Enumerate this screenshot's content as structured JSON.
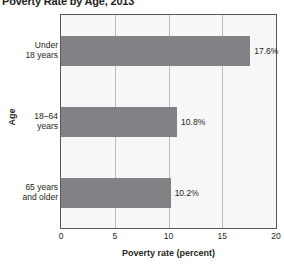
{
  "chart_data": {
    "type": "bar",
    "orientation": "horizontal",
    "title": "Poverty Rate by Age, 2013",
    "xlabel": "Poverty rate (percent)",
    "ylabel": "Age",
    "categories": [
      "Under 18 years",
      "18–64 years",
      "65 years and older"
    ],
    "category_lines": [
      [
        "Under",
        "18 years"
      ],
      [
        "18–64",
        "years"
      ],
      [
        "65 years",
        "and older"
      ]
    ],
    "values": [
      17.6,
      10.8,
      10.2
    ],
    "value_labels": [
      "17.6%",
      "10.8%",
      "10.2%"
    ],
    "xlim": [
      0,
      20
    ],
    "xticks": [
      0,
      5,
      10,
      15,
      20
    ],
    "xtick_labels": [
      "0",
      "5",
      "10",
      "15",
      "20"
    ],
    "gridlines": [
      5,
      10,
      15
    ],
    "grid": true,
    "legend": null,
    "colors": {
      "bar": "#808285",
      "plot_background": "#f7f7f7",
      "gridline": "#b9babc",
      "axis": "#58595b",
      "text": "#231f20"
    }
  }
}
